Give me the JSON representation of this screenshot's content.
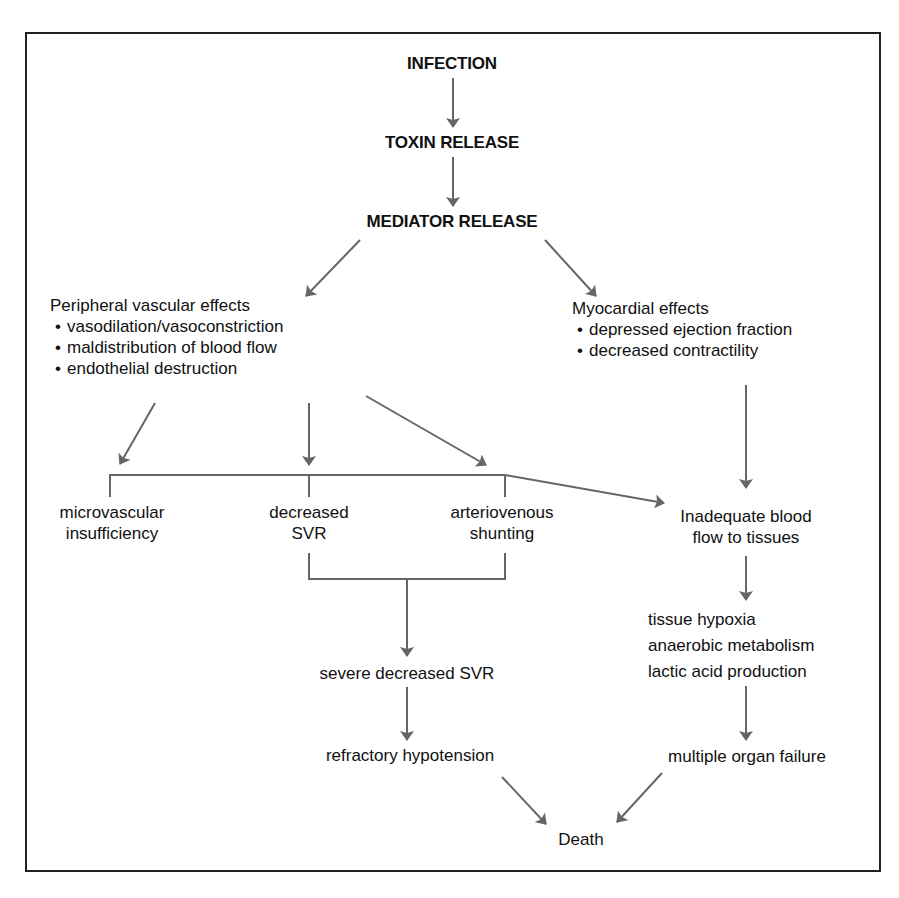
{
  "colors": {
    "arrow": "#666666",
    "text": "#111111",
    "frame": "#222222"
  },
  "diagram": {
    "top_chain": {
      "infection": "INFECTION",
      "toxin_release": "TOXIN RELEASE",
      "mediator_release": "MEDIATOR RELEASE"
    },
    "peripheral": {
      "title": "Peripheral vascular effects",
      "items": [
        "vasodilation/vasoconstriction",
        "maldistribution of blood flow",
        "endothelial destruction"
      ]
    },
    "myocardial": {
      "title": "Myocardial effects",
      "items": [
        "depressed ejection fraction",
        "decreased contractility"
      ]
    },
    "microvascular": {
      "line1": "microvascular",
      "line2": "insufficiency"
    },
    "decreased_svr": {
      "line1": "decreased",
      "line2": "SVR"
    },
    "av_shunting": {
      "line1": "arteriovenous",
      "line2": "shunting"
    },
    "inadequate_flow": {
      "line1": "Inadequate blood",
      "line2": "flow to tissues"
    },
    "tissue_effects": {
      "line1": "tissue hypoxia",
      "line2": "anaerobic metabolism",
      "line3": "lactic acid production"
    },
    "severe_svr": "severe decreased SVR",
    "refractory_hypotension": "refractory hypotension",
    "multiple_organ_failure": "multiple organ failure",
    "death": "Death"
  }
}
